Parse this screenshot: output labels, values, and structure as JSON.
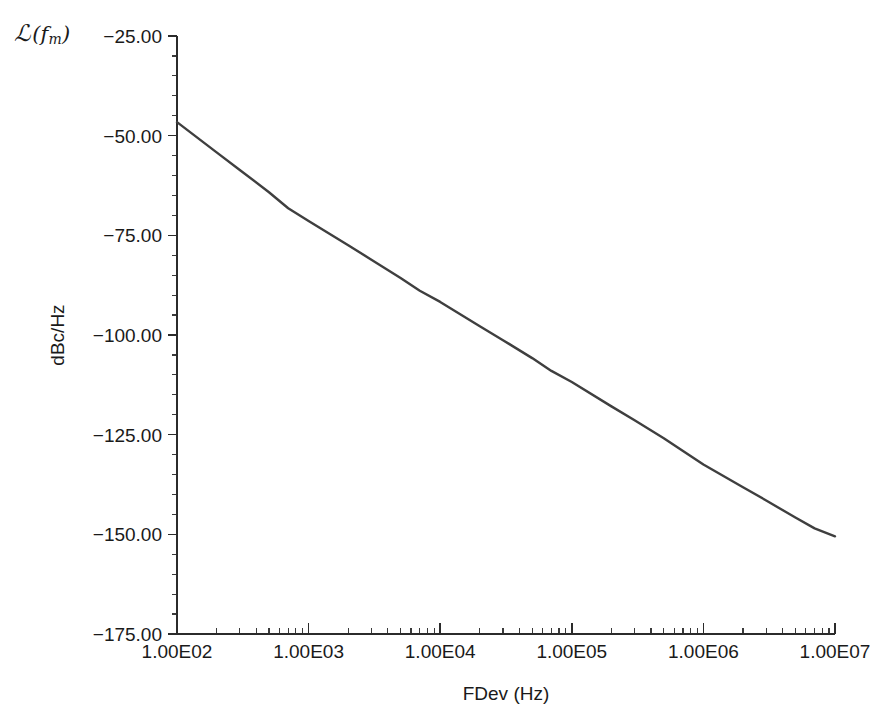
{
  "figure": {
    "corner_symbol": {
      "script_l": "ℒ",
      "open_paren": "(",
      "f": "f",
      "subscript": "m",
      "close_paren": ")",
      "plain": "L(fm)"
    },
    "background_color": "#ffffff",
    "line_color": "#3f3f3f",
    "axis_color": "#2b2b2b",
    "bottom_artifact_text": ""
  },
  "chart_data": {
    "type": "line",
    "title": "",
    "xlabel": "FDev (Hz)",
    "ylabel": "dBc/Hz",
    "corner_label": "ℒ(fm)",
    "xscale": "log",
    "yscale": "linear",
    "xlim": [
      100,
      10000000
    ],
    "ylim": [
      -175,
      -25
    ],
    "grid": false,
    "legend": null,
    "x_tick_labels": [
      "1.00E02",
      "1.00E03",
      "1.00E04",
      "1.00E05",
      "1.00E06",
      "1.00E07"
    ],
    "x_tick_values": [
      100,
      1000,
      10000,
      100000,
      1000000,
      10000000
    ],
    "y_tick_labels": [
      "-25.00",
      "-50.00",
      "-75.00",
      "-100.00",
      "-125.00",
      "-150.00",
      "-175.00"
    ],
    "y_tick_values": [
      -25,
      -50,
      -75,
      -100,
      -125,
      -150,
      -175
    ],
    "y_minor_step": 5,
    "series": [
      {
        "name": "phase-noise",
        "x": [
          100,
          200,
          300,
          500,
          700,
          1000,
          2000,
          3000,
          5000,
          7000,
          10000,
          20000,
          30000,
          50000,
          70000,
          100000,
          200000,
          300000,
          500000,
          700000,
          1000000,
          2000000,
          3000000,
          5000000,
          7000000,
          10000000
        ],
        "values": [
          -46.6,
          -54.2,
          -58.6,
          -64.2,
          -68.2,
          -71.4,
          -77.5,
          -81.1,
          -85.7,
          -88.9,
          -91.7,
          -97.8,
          -101.3,
          -105.8,
          -109.0,
          -111.8,
          -117.9,
          -121.4,
          -125.9,
          -129.1,
          -132.5,
          -138.2,
          -141.5,
          -145.8,
          -148.5,
          -150.5
        ]
      }
    ]
  }
}
